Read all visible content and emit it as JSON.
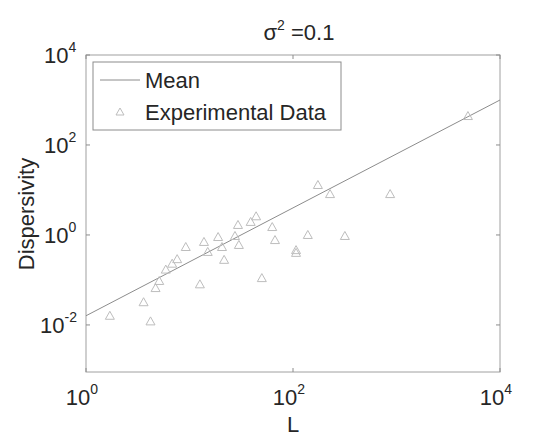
{
  "chart_data": {
    "type": "scatter",
    "title_base": "σ",
    "title_sup": "2",
    "title_rest": " =0.1",
    "xlabel": "L",
    "ylabel": "Dispersivity",
    "xscale": "log",
    "yscale": "log",
    "xlim": [
      1,
      10000
    ],
    "ylim": [
      0.0009,
      10000
    ],
    "x_ticks": [
      {
        "base": "10",
        "exp": "0",
        "value": 1
      },
      {
        "base": "10",
        "exp": "2",
        "value": 100
      },
      {
        "base": "10",
        "exp": "4",
        "value": 10000
      }
    ],
    "y_ticks": [
      {
        "base": "10",
        "exp": "-2",
        "value": 0.01
      },
      {
        "base": "10",
        "exp": "0",
        "value": 1
      },
      {
        "base": "10",
        "exp": "2",
        "value": 100
      },
      {
        "base": "10",
        "exp": "4",
        "value": 10000
      }
    ],
    "grid": false,
    "legend_position": "upper left",
    "series": [
      {
        "name": "Mean",
        "kind": "line",
        "color": "#8c8c8c",
        "x": [
          1,
          10000
        ],
        "y": [
          0.016,
          1000
        ]
      },
      {
        "name": "Experimental Data",
        "kind": "scatter",
        "marker": "triangle",
        "color": "#bdbdbd",
        "x": [
          1.7,
          3.6,
          4.2,
          4.7,
          5.1,
          5.9,
          6.8,
          7.6,
          9.2,
          12.6,
          13.8,
          15,
          18.9,
          20.6,
          21.6,
          27.5,
          29.4,
          30,
          39,
          44,
          50,
          63,
          67,
          107,
          107,
          139,
          174,
          228,
          317,
          868,
          4900
        ],
        "y": [
          0.016,
          0.032,
          0.012,
          0.066,
          0.095,
          0.17,
          0.23,
          0.29,
          0.54,
          0.08,
          0.7,
          0.42,
          0.9,
          0.54,
          0.28,
          0.95,
          1.67,
          0.6,
          1.95,
          2.6,
          0.11,
          1.5,
          0.77,
          0.46,
          0.4,
          1.0,
          12.9,
          8.1,
          0.95,
          8.1,
          440
        ]
      }
    ]
  },
  "legend": {
    "items": [
      {
        "label": "Mean"
      },
      {
        "label": "Experimental Data"
      }
    ]
  },
  "colors": {
    "axis": "#8c8c8c",
    "mean_line": "#8c8c8c",
    "marker": "#bdbdbd",
    "text": "#262626"
  }
}
